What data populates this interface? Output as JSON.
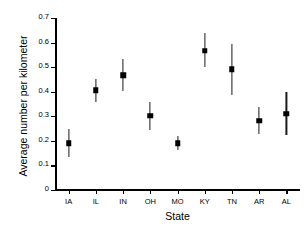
{
  "chart_data": {
    "type": "scatter",
    "title": "",
    "xlabel": "State",
    "ylabel": "Average number per kilometer",
    "categories": [
      "IA",
      "IL",
      "IN",
      "OH",
      "MO",
      "KY",
      "TN",
      "AR",
      "AL"
    ],
    "values": [
      0.19,
      0.405,
      0.467,
      0.303,
      0.19,
      0.566,
      0.492,
      0.281,
      0.311
    ],
    "error_low": [
      0.135,
      0.357,
      0.404,
      0.243,
      0.163,
      0.501,
      0.387,
      0.228,
      0.223
    ],
    "error_high": [
      0.247,
      0.452,
      0.533,
      0.36,
      0.221,
      0.637,
      0.596,
      0.337,
      0.4
    ],
    "ylim": [
      0,
      0.7
    ],
    "ytick_labels": [
      "0",
      "0.1",
      "0.2",
      "0.3",
      "0.4",
      "0.5",
      "0.6",
      "0.7"
    ],
    "ytick_values": [
      0,
      0.1,
      0.2,
      0.3,
      0.4,
      0.5,
      0.6,
      0.7
    ],
    "grid": false,
    "legend": "none",
    "marker_color": "#000000",
    "errorbar_color": "#1a1a1a",
    "axis_color": "#000000"
  }
}
